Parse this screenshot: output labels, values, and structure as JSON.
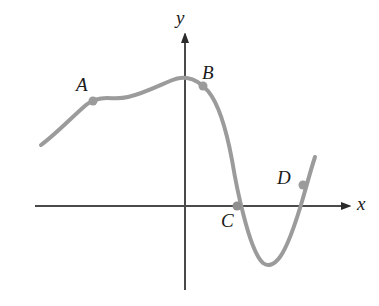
{
  "figure": {
    "type": "math-graph",
    "background_color": "#ffffff",
    "width": 379,
    "height": 306
  },
  "axes": {
    "x_axis": {
      "label": "x",
      "label_x": 357,
      "label_y": 210,
      "color": "#4a4a4a",
      "y_pixel": 206,
      "x_start": 35,
      "x_end": 350,
      "arrow": "right"
    },
    "y_axis": {
      "label": "y",
      "label_x": 176,
      "label_y": 24,
      "color": "#4a4a4a",
      "x_pixel": 185,
      "y_start": 290,
      "y_end": 32,
      "arrow": "up"
    }
  },
  "curve": {
    "color": "#9b9b9b",
    "stroke_width": 4,
    "path": "M 41 145 C 56 134, 72 117, 86 105 C 92 100, 99 98, 107 98 C 114 98, 120 99, 128 97 C 142 94, 156 87, 170 81 C 177 78, 182 77, 187 78 C 194 79, 201 83, 208 91 C 218 103, 226 128, 232 160 C 236 184, 239 198, 243 213 C 249 237, 255 256, 263 263 C 268 267, 274 265, 280 257 C 288 246, 296 222, 303 198 C 307 184, 311 169, 315 157"
  },
  "points": [
    {
      "label": "A",
      "cx": 93,
      "cy": 101,
      "label_x": 76,
      "label_y": 91,
      "color": "#9b9b9b"
    },
    {
      "label": "B",
      "cx": 203,
      "cy": 86,
      "label_x": 202,
      "label_y": 79,
      "color": "#9b9b9b"
    },
    {
      "label": "C",
      "cx": 237,
      "cy": 206,
      "label_x": 221,
      "label_y": 227,
      "color": "#9b9b9b"
    },
    {
      "label": "D",
      "cx": 303,
      "cy": 185,
      "label_x": 277,
      "label_y": 184,
      "color": "#9b9b9b"
    }
  ],
  "colors": {
    "curve": "#9b9b9b",
    "axis": "#4a4a4a",
    "text": "#1a1a1a",
    "marker": "#9b9b9b"
  }
}
